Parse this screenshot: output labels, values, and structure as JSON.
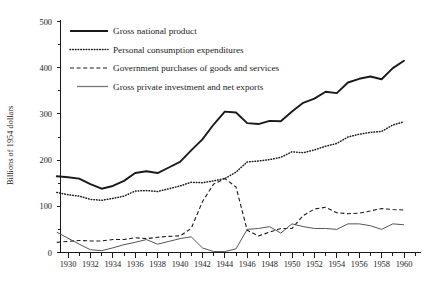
{
  "chart_data": {
    "type": "line",
    "title": "",
    "subtitle": "",
    "xlabel": "",
    "ylabel": "Billions of 1954 dollars",
    "xlim": [
      1929,
      1961
    ],
    "ylim": [
      0,
      520
    ],
    "grid": false,
    "legend_position": "top-left",
    "x_tick_labels": [
      "1930",
      "1932",
      "1934",
      "1936",
      "1938",
      "1940",
      "1942",
      "1944",
      "1946",
      "1948",
      "1950",
      "1952",
      "1954",
      "1956",
      "1958",
      "1960"
    ],
    "x_tick_values": [
      1930,
      1932,
      1934,
      1936,
      1938,
      1940,
      1942,
      1944,
      1946,
      1948,
      1950,
      1952,
      1954,
      1956,
      1958,
      1960
    ],
    "x_minor_tick_values": [
      1931,
      1933,
      1935,
      1937,
      1939,
      1941,
      1943,
      1945,
      1947,
      1949,
      1951,
      1953,
      1955,
      1957,
      1959,
      1961
    ],
    "y_tick_labels": [
      "0",
      "100",
      "200",
      "300",
      "400",
      "500"
    ],
    "y_tick_values": [
      0,
      100,
      200,
      300,
      400,
      500
    ],
    "y_minor_tick_values": [
      50,
      150,
      250,
      350,
      450
    ],
    "x": [
      1929,
      1930,
      1931,
      1932,
      1933,
      1934,
      1935,
      1936,
      1937,
      1938,
      1939,
      1940,
      1941,
      1942,
      1943,
      1944,
      1945,
      1946,
      1947,
      1948,
      1949,
      1950,
      1951,
      1952,
      1953,
      1954,
      1955,
      1956,
      1957,
      1958,
      1959,
      1960
    ],
    "series": [
      {
        "name": "Gross national product",
        "style": "solid-thick",
        "color": "#1a1a1a",
        "values": [
          165,
          163,
          160,
          148,
          138,
          144,
          155,
          172,
          176,
          172,
          184,
          196,
          221,
          245,
          277,
          305,
          303,
          280,
          278,
          285,
          284,
          305,
          324,
          333,
          348,
          345,
          368,
          376,
          381,
          375,
          399,
          415
        ]
      },
      {
        "name": "Personal consumption expenditures",
        "style": "dotted",
        "color": "#1a1a1a",
        "values": [
          130,
          125,
          122,
          115,
          113,
          117,
          122,
          133,
          134,
          132,
          138,
          144,
          152,
          151,
          155,
          160,
          174,
          196,
          198,
          201,
          206,
          218,
          216,
          222,
          230,
          236,
          250,
          256,
          260,
          262,
          276,
          283
        ]
      },
      {
        "name": "Government purchases of goods and services",
        "style": "dashed",
        "color": "#1a1a1a",
        "values": [
          22,
          24,
          26,
          25,
          25,
          28,
          28,
          32,
          30,
          33,
          35,
          36,
          52,
          110,
          148,
          160,
          142,
          48,
          36,
          44,
          52,
          52,
          80,
          94,
          98,
          86,
          84,
          85,
          90,
          95,
          93,
          92
        ]
      },
      {
        "name": "Gross private investment and net exports",
        "style": "solid-thin",
        "color": "#555555",
        "values": [
          44,
          31,
          18,
          6,
          4,
          10,
          17,
          22,
          28,
          18,
          24,
          30,
          34,
          10,
          2,
          2,
          8,
          50,
          52,
          56,
          42,
          62,
          56,
          52,
          52,
          50,
          62,
          62,
          58,
          50,
          62,
          60
        ]
      }
    ]
  },
  "axes": {
    "y_title": "Billions of 1954 dollars"
  },
  "legend": {
    "items": [
      {
        "label": "Gross national product",
        "swatch": "solid-thick-line-icon"
      },
      {
        "label": "Personal consumption expenditures",
        "swatch": "dotted-line-icon"
      },
      {
        "label": "Government purchases of goods and services",
        "swatch": "dashed-line-icon"
      },
      {
        "label": "Gross private investment and net exports",
        "swatch": "thin-line-icon"
      }
    ]
  }
}
